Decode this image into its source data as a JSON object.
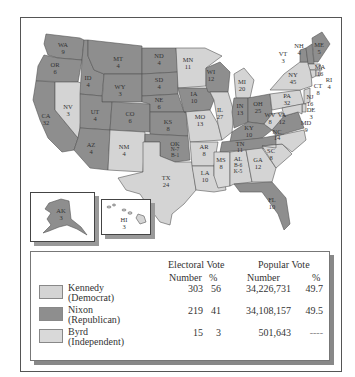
{
  "colors": {
    "democrat": "#d4d4d4",
    "republican": "#8e8e8e",
    "independent": "#d9d9d9",
    "unpledged": "#6e6e6e",
    "border": "#555555"
  },
  "states": [
    {
      "abbr": "WA",
      "ev": "9",
      "party": "R"
    },
    {
      "abbr": "OR",
      "ev": "6",
      "party": "R"
    },
    {
      "abbr": "CA",
      "ev": "32",
      "party": "R"
    },
    {
      "abbr": "NV",
      "ev": "3",
      "party": "D"
    },
    {
      "abbr": "ID",
      "ev": "4",
      "party": "R"
    },
    {
      "abbr": "MT",
      "ev": "4",
      "party": "R"
    },
    {
      "abbr": "WY",
      "ev": "3",
      "party": "R"
    },
    {
      "abbr": "UT",
      "ev": "4",
      "party": "R"
    },
    {
      "abbr": "CO",
      "ev": "6",
      "party": "R"
    },
    {
      "abbr": "AZ",
      "ev": "4",
      "party": "R"
    },
    {
      "abbr": "NM",
      "ev": "4",
      "party": "D"
    },
    {
      "abbr": "ND",
      "ev": "4",
      "party": "R"
    },
    {
      "abbr": "SD",
      "ev": "4",
      "party": "R"
    },
    {
      "abbr": "NE",
      "ev": "6",
      "party": "R"
    },
    {
      "abbr": "KS",
      "ev": "8",
      "party": "R"
    },
    {
      "abbr": "OK",
      "ev": "N-7 B-1",
      "party": "R"
    },
    {
      "abbr": "TX",
      "ev": "24",
      "party": "D"
    },
    {
      "abbr": "MN",
      "ev": "11",
      "party": "D"
    },
    {
      "abbr": "IA",
      "ev": "10",
      "party": "R"
    },
    {
      "abbr": "MO",
      "ev": "13",
      "party": "D"
    },
    {
      "abbr": "AR",
      "ev": "8",
      "party": "D"
    },
    {
      "abbr": "LA",
      "ev": "10",
      "party": "D"
    },
    {
      "abbr": "WI",
      "ev": "12",
      "party": "R"
    },
    {
      "abbr": "IL",
      "ev": "27",
      "party": "D"
    },
    {
      "abbr": "MI",
      "ev": "20",
      "party": "D"
    },
    {
      "abbr": "IN",
      "ev": "13",
      "party": "R"
    },
    {
      "abbr": "OH",
      "ev": "25",
      "party": "R"
    },
    {
      "abbr": "KY",
      "ev": "10",
      "party": "R"
    },
    {
      "abbr": "TN",
      "ev": "11",
      "party": "R"
    },
    {
      "abbr": "MS",
      "ev": "8",
      "party": "I"
    },
    {
      "abbr": "AL",
      "ev": "B-6 K-5",
      "party": "D"
    },
    {
      "abbr": "GA",
      "ev": "12",
      "party": "D"
    },
    {
      "abbr": "FL",
      "ev": "10",
      "party": "R"
    },
    {
      "abbr": "SC",
      "ev": "8",
      "party": "D"
    },
    {
      "abbr": "NC",
      "ev": "14",
      "party": "D"
    },
    {
      "abbr": "VA",
      "ev": "12",
      "party": "R"
    },
    {
      "abbr": "WV",
      "ev": "8",
      "party": "D"
    },
    {
      "abbr": "PA",
      "ev": "32",
      "party": "D"
    },
    {
      "abbr": "NY",
      "ev": "45",
      "party": "D"
    },
    {
      "abbr": "VT",
      "ev": "3",
      "party": "R"
    },
    {
      "abbr": "NH",
      "ev": "4",
      "party": "R"
    },
    {
      "abbr": "ME",
      "ev": "5",
      "party": "R"
    },
    {
      "abbr": "MA",
      "ev": "16",
      "party": "D"
    },
    {
      "abbr": "RI",
      "ev": "4",
      "party": "D"
    },
    {
      "abbr": "CT",
      "ev": "8",
      "party": "D"
    },
    {
      "abbr": "NJ",
      "ev": "16",
      "party": "D"
    },
    {
      "abbr": "DE",
      "ev": "3",
      "party": "D"
    },
    {
      "abbr": "MD",
      "ev": "9",
      "party": "D"
    },
    {
      "abbr": "AK",
      "ev": "3",
      "party": "R"
    },
    {
      "abbr": "HI",
      "ev": "3",
      "party": "D"
    }
  ],
  "legend": {
    "headers": {
      "electoral": "Electoral Vote",
      "popular": "Popular Vote",
      "ev_number": "Number",
      "ev_pct": "%",
      "pv_number": "Number",
      "pv_pct": "%"
    },
    "rows": [
      {
        "name": "Kennedy",
        "party": "(Democrat)",
        "ev": "303",
        "ev_pct": "56",
        "pv": "34,226,731",
        "pv_pct": "49.7",
        "color": "#d4d4d4"
      },
      {
        "name": "Nixon",
        "party": "(Republican)",
        "ev": "219",
        "ev_pct": "41",
        "pv": "34,108,157",
        "pv_pct": "49.5",
        "color": "#8e8e8e"
      },
      {
        "name": "Byrd",
        "party": "(Independent)",
        "ev": "15",
        "ev_pct": "3",
        "pv": "501,643",
        "pv_pct": "----",
        "color": "#d9d9d9"
      }
    ]
  }
}
